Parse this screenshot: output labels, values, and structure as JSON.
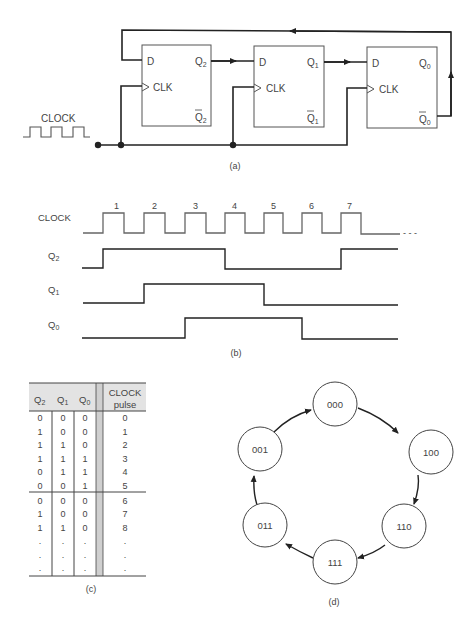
{
  "part_a": {
    "caption": "(a)",
    "clock_label": "CLOCK",
    "flipflops": [
      {
        "d": "D",
        "clk": "CLK",
        "q": "Q",
        "q_sub": "2",
        "qbar": "Q",
        "qbar_sub": "2"
      },
      {
        "d": "D",
        "clk": "CLK",
        "q": "Q",
        "q_sub": "1",
        "qbar": "Q",
        "qbar_sub": "1"
      },
      {
        "d": "D",
        "clk": "CLK",
        "q": "Q",
        "q_sub": "0",
        "qbar": "Q",
        "qbar_sub": "0"
      }
    ]
  },
  "part_b": {
    "caption": "(b)",
    "signals": [
      {
        "name": "CLOCK",
        "sub": ""
      },
      {
        "name": "Q",
        "sub": "2"
      },
      {
        "name": "Q",
        "sub": "1"
      },
      {
        "name": "Q",
        "sub": "0"
      }
    ],
    "pulse_numbers": [
      "1",
      "2",
      "3",
      "4",
      "5",
      "6",
      "7"
    ],
    "ellipsis": "- - -"
  },
  "part_c": {
    "caption": "(c)",
    "headers": [
      {
        "text": "Q",
        "sub": "2"
      },
      {
        "text": "Q",
        "sub": "1"
      },
      {
        "text": "Q",
        "sub": "0"
      },
      {
        "text": "CLOCK",
        "text2": "pulse"
      }
    ],
    "rows": [
      [
        "0",
        "0",
        "0",
        "0"
      ],
      [
        "1",
        "0",
        "0",
        "1"
      ],
      [
        "1",
        "1",
        "0",
        "2"
      ],
      [
        "1",
        "1",
        "1",
        "3"
      ],
      [
        "0",
        "1",
        "1",
        "4"
      ],
      [
        "0",
        "0",
        "1",
        "5"
      ],
      [
        "0",
        "0",
        "0",
        "6"
      ],
      [
        "1",
        "0",
        "0",
        "7"
      ],
      [
        "1",
        "1",
        "0",
        "8"
      ],
      [
        ".",
        ".",
        ".",
        "."
      ],
      [
        ".",
        ".",
        ".",
        "."
      ],
      [
        ".",
        ".",
        ".",
        "."
      ]
    ]
  },
  "part_d": {
    "caption": "(d)",
    "states": [
      "000",
      "100",
      "110",
      "111",
      "011",
      "001"
    ]
  }
}
